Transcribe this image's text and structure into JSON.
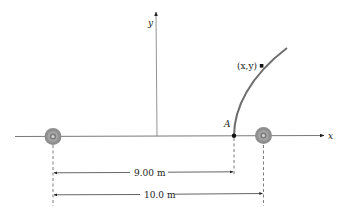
{
  "diagram": {
    "axes": {
      "x_label": "x",
      "y_label": "y"
    },
    "point_A": {
      "label": "A"
    },
    "point_xy": {
      "label": "(x,y)"
    },
    "speakers": [
      {
        "name": "left-speaker"
      },
      {
        "name": "right-speaker"
      }
    ],
    "dimensions": {
      "d1": {
        "label": "9.00 m"
      },
      "d2": {
        "label": "10.0 m"
      }
    },
    "colors": {
      "curve": "#6e6e6e",
      "speaker_outer": "#8a8a8a",
      "speaker_inner": "#b5b5b5",
      "axis": "#555555"
    }
  }
}
